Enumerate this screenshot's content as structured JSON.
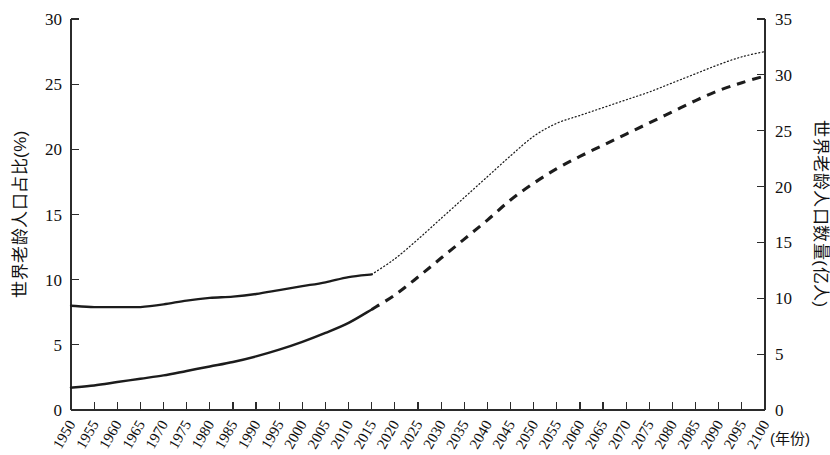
{
  "chart_data": {
    "type": "line",
    "title": "",
    "subtitle": "",
    "xlabel": "(年份)",
    "ylabel": "世界老龄人口占比(%)",
    "y2label": "世界老龄人口数量(亿人)",
    "grid": false,
    "legend_position": "none",
    "xlim": [
      1950,
      2100
    ],
    "ylim": [
      0,
      30
    ],
    "y2lim": [
      0,
      35
    ],
    "yticks": [
      0,
      5,
      10,
      15,
      20,
      25,
      30
    ],
    "y2ticks": [
      0,
      5,
      10,
      15,
      20,
      25,
      30,
      35
    ],
    "xticks": [
      1950,
      1955,
      1960,
      1965,
      1970,
      1975,
      1980,
      1985,
      1990,
      1995,
      2000,
      2005,
      2010,
      2015,
      2020,
      2025,
      2030,
      2035,
      2040,
      2045,
      2050,
      2055,
      2060,
      2065,
      2070,
      2075,
      2080,
      2085,
      2090,
      2095,
      2100
    ],
    "x": [
      1950,
      1955,
      1960,
      1965,
      1970,
      1975,
      1980,
      1985,
      1990,
      1995,
      2000,
      2005,
      2010,
      2015,
      2020,
      2025,
      2030,
      2035,
      2040,
      2045,
      2050,
      2055,
      2060,
      2065,
      2070,
      2075,
      2080,
      2085,
      2090,
      2095,
      2100
    ],
    "projection_starts_at": 2015,
    "series": [
      {
        "name": "世界老龄人口占比(%)",
        "axis": "left",
        "unit": "%",
        "style_historical": "solid",
        "style_projected": "dotted",
        "values": [
          8.0,
          7.9,
          7.9,
          7.9,
          8.1,
          8.4,
          8.6,
          8.7,
          8.9,
          9.2,
          9.5,
          9.8,
          10.2,
          10.4,
          11.6,
          13.1,
          14.7,
          16.3,
          17.9,
          19.5,
          21.0,
          22.0,
          22.6,
          23.2,
          23.8,
          24.4,
          25.1,
          25.8,
          26.5,
          27.1,
          27.5
        ]
      },
      {
        "name": "世界老龄人口数量(亿人)",
        "axis": "right",
        "unit": "亿人",
        "style_historical": "solid",
        "style_projected": "dashed",
        "values": [
          2.0,
          2.2,
          2.5,
          2.8,
          3.1,
          3.5,
          3.9,
          4.3,
          4.8,
          5.4,
          6.1,
          6.9,
          7.8,
          9.0,
          10.3,
          11.9,
          13.6,
          15.3,
          17.0,
          18.8,
          20.3,
          21.6,
          22.7,
          23.7,
          24.7,
          25.7,
          26.7,
          27.7,
          28.6,
          29.3,
          29.9
        ]
      }
    ]
  }
}
